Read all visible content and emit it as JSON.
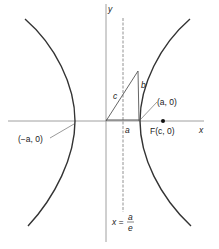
{
  "diagram": {
    "type": "hyperbola-focus-directrix",
    "axes": {
      "x_label": "x",
      "y_label": "y"
    },
    "labels": {
      "left_vertex": "(−a, 0)",
      "right_vertex": "(a, 0)",
      "focus": "F(c, 0)",
      "base": "a",
      "hypotenuse": "c",
      "height": "b",
      "directrix_lhs": "x =",
      "directrix_num": "a",
      "directrix_den": "e"
    },
    "colors": {
      "ink": "#222222",
      "curve": "#333333"
    }
  }
}
